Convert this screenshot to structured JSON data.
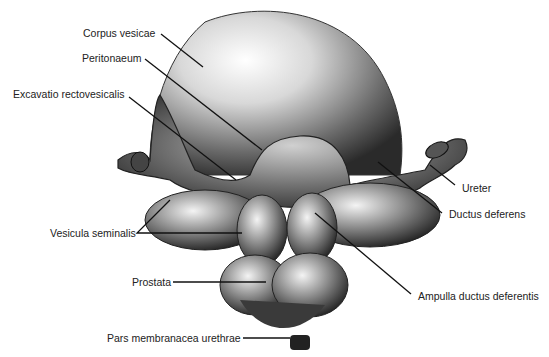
{
  "figure": {
    "colors": {
      "ink": "#111111",
      "background": "#ffffff",
      "organ_light": "#e8e8e8",
      "organ_dark": "#2a2a2a"
    }
  },
  "labels": {
    "corpus_vesicae": "Corpus vesicae",
    "peritonaeum": "Peritonaeum",
    "excavatio": "Excavatio rectovesicalis",
    "ureter": "Ureter",
    "ductus_deferens": "Ductus deferens",
    "vesicula_seminalis": "Vesicula seminalis",
    "prostata": "Prostata",
    "ampulla": "Ampulla ductus deferentis",
    "pars_membranacea": "Pars membranacea urethrae"
  }
}
